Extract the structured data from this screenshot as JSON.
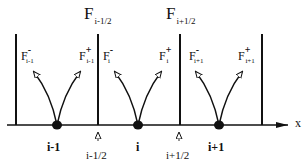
{
  "diagram": {
    "axis_label": "x",
    "interface_fluxes": [
      {
        "symbol": "F",
        "sub": "i-1/2"
      },
      {
        "symbol": "F",
        "sub": "i+1/2"
      }
    ],
    "cell_fluxes": [
      {
        "symbol": "F",
        "sign": "-",
        "sub": "i-1"
      },
      {
        "symbol": "F",
        "sign": "+",
        "sub": "i-1"
      },
      {
        "symbol": "F",
        "sign": "-",
        "sub": "i"
      },
      {
        "symbol": "F",
        "sign": "+",
        "sub": "i"
      },
      {
        "symbol": "F",
        "sign": "-",
        "sub": "i+1"
      },
      {
        "symbol": "F",
        "sign": "+",
        "sub": "i+1"
      }
    ],
    "nodes": [
      "i-1",
      "i",
      "i+1"
    ],
    "interfaces": [
      "i-1/2",
      "i+1/2"
    ],
    "colors": {
      "ink": "#111111",
      "background": "#ffffff"
    }
  }
}
